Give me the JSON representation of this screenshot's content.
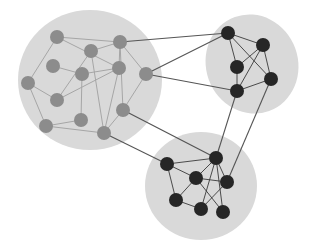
{
  "diagram": {
    "type": "clustered-network-graph",
    "colors": {
      "background": "#ffffff",
      "cluster_fill": "#d9d9d9",
      "grey_node": "#8c8c8c",
      "dark_node": "#262626",
      "intra_edge_light": "#a6a6a6",
      "inter_edge": "#555555",
      "intra_edge_dark": "#3a3a3a"
    },
    "clusters": [
      {
        "id": "left",
        "shape": "circle",
        "cx": 90,
        "cy": 80,
        "rx": 72,
        "ry": 70,
        "rotate": 0
      },
      {
        "id": "top-right",
        "shape": "ellipse",
        "cx": 252,
        "cy": 64,
        "rx": 46,
        "ry": 50,
        "rotate": -20
      },
      {
        "id": "bottom",
        "shape": "circle",
        "cx": 201,
        "cy": 186,
        "rx": 56,
        "ry": 54,
        "rotate": 0
      }
    ],
    "nodes": [
      {
        "id": "A",
        "x": 57,
        "y": 37,
        "cluster": "left",
        "style": "grey"
      },
      {
        "id": "B",
        "x": 120,
        "y": 42,
        "cluster": "left",
        "style": "grey"
      },
      {
        "id": "C",
        "x": 91,
        "y": 51,
        "cluster": "left",
        "style": "grey"
      },
      {
        "id": "D",
        "x": 53,
        "y": 66,
        "cluster": "left",
        "style": "grey"
      },
      {
        "id": "E",
        "x": 82,
        "y": 74,
        "cluster": "left",
        "style": "grey"
      },
      {
        "id": "F",
        "x": 119,
        "y": 68,
        "cluster": "left",
        "style": "grey"
      },
      {
        "id": "G",
        "x": 146,
        "y": 74,
        "cluster": "left",
        "style": "grey"
      },
      {
        "id": "H",
        "x": 28,
        "y": 83,
        "cluster": "left",
        "style": "grey"
      },
      {
        "id": "I",
        "x": 57,
        "y": 100,
        "cluster": "left",
        "style": "grey"
      },
      {
        "id": "J",
        "x": 123,
        "y": 110,
        "cluster": "left",
        "style": "grey"
      },
      {
        "id": "K",
        "x": 46,
        "y": 126,
        "cluster": "left",
        "style": "grey"
      },
      {
        "id": "L",
        "x": 81,
        "y": 120,
        "cluster": "left",
        "style": "grey"
      },
      {
        "id": "M",
        "x": 104,
        "y": 133,
        "cluster": "left",
        "style": "grey"
      },
      {
        "id": "N",
        "x": 228,
        "y": 33,
        "cluster": "top-right",
        "style": "dark"
      },
      {
        "id": "O",
        "x": 263,
        "y": 45,
        "cluster": "top-right",
        "style": "dark"
      },
      {
        "id": "P",
        "x": 237,
        "y": 67,
        "cluster": "top-right",
        "style": "dark"
      },
      {
        "id": "Q",
        "x": 271,
        "y": 79,
        "cluster": "top-right",
        "style": "dark"
      },
      {
        "id": "R",
        "x": 237,
        "y": 91,
        "cluster": "top-right",
        "style": "dark"
      },
      {
        "id": "S",
        "x": 167,
        "y": 164,
        "cluster": "bottom",
        "style": "dark"
      },
      {
        "id": "T",
        "x": 216,
        "y": 158,
        "cluster": "bottom",
        "style": "dark"
      },
      {
        "id": "U",
        "x": 196,
        "y": 178,
        "cluster": "bottom",
        "style": "dark"
      },
      {
        "id": "V",
        "x": 227,
        "y": 182,
        "cluster": "bottom",
        "style": "dark"
      },
      {
        "id": "W",
        "x": 176,
        "y": 200,
        "cluster": "bottom",
        "style": "dark"
      },
      {
        "id": "X",
        "x": 201,
        "y": 209,
        "cluster": "bottom",
        "style": "dark"
      },
      {
        "id": "Y",
        "x": 223,
        "y": 212,
        "cluster": "bottom",
        "style": "dark"
      }
    ],
    "edges": [
      {
        "from": "A",
        "to": "B",
        "kind": "intra-light"
      },
      {
        "from": "A",
        "to": "H",
        "kind": "intra-light"
      },
      {
        "from": "A",
        "to": "F",
        "kind": "intra-light"
      },
      {
        "from": "C",
        "to": "B",
        "kind": "intra-light"
      },
      {
        "from": "C",
        "to": "I",
        "kind": "intra-light"
      },
      {
        "from": "C",
        "to": "M",
        "kind": "intra-light"
      },
      {
        "from": "B",
        "to": "F",
        "kind": "intra-light"
      },
      {
        "from": "B",
        "to": "J",
        "kind": "intra-light"
      },
      {
        "from": "D",
        "to": "E",
        "kind": "intra-light"
      },
      {
        "from": "E",
        "to": "F",
        "kind": "intra-light"
      },
      {
        "from": "E",
        "to": "L",
        "kind": "intra-light"
      },
      {
        "from": "F",
        "to": "I",
        "kind": "intra-light"
      },
      {
        "from": "F",
        "to": "M",
        "kind": "intra-light"
      },
      {
        "from": "G",
        "to": "J",
        "kind": "intra-light"
      },
      {
        "from": "G",
        "to": "B",
        "kind": "intra-light"
      },
      {
        "from": "H",
        "to": "I",
        "kind": "intra-light"
      },
      {
        "from": "H",
        "to": "K",
        "kind": "intra-light"
      },
      {
        "from": "K",
        "to": "L",
        "kind": "intra-light"
      },
      {
        "from": "K",
        "to": "M",
        "kind": "intra-light"
      },
      {
        "from": "J",
        "to": "M",
        "kind": "intra-light"
      },
      {
        "from": "N",
        "to": "O",
        "kind": "intra-dark"
      },
      {
        "from": "N",
        "to": "P",
        "kind": "intra-dark"
      },
      {
        "from": "N",
        "to": "Q",
        "kind": "intra-dark"
      },
      {
        "from": "O",
        "to": "P",
        "kind": "intra-dark"
      },
      {
        "from": "O",
        "to": "Q",
        "kind": "intra-dark"
      },
      {
        "from": "O",
        "to": "R",
        "kind": "intra-dark"
      },
      {
        "from": "P",
        "to": "R",
        "kind": "intra-dark"
      },
      {
        "from": "Q",
        "to": "R",
        "kind": "intra-dark"
      },
      {
        "from": "S",
        "to": "T",
        "kind": "intra-dark"
      },
      {
        "from": "S",
        "to": "U",
        "kind": "intra-dark"
      },
      {
        "from": "S",
        "to": "W",
        "kind": "intra-dark"
      },
      {
        "from": "T",
        "to": "U",
        "kind": "intra-dark"
      },
      {
        "from": "T",
        "to": "V",
        "kind": "intra-dark"
      },
      {
        "from": "T",
        "to": "X",
        "kind": "intra-dark"
      },
      {
        "from": "T",
        "to": "Y",
        "kind": "intra-dark"
      },
      {
        "from": "U",
        "to": "V",
        "kind": "intra-dark"
      },
      {
        "from": "U",
        "to": "W",
        "kind": "intra-dark"
      },
      {
        "from": "U",
        "to": "Y",
        "kind": "intra-dark"
      },
      {
        "from": "V",
        "to": "X",
        "kind": "intra-dark"
      },
      {
        "from": "W",
        "to": "X",
        "kind": "intra-dark"
      },
      {
        "from": "B",
        "to": "N",
        "kind": "inter"
      },
      {
        "from": "G",
        "to": "N",
        "kind": "inter"
      },
      {
        "from": "G",
        "to": "R",
        "kind": "inter"
      },
      {
        "from": "J",
        "to": "T",
        "kind": "inter"
      },
      {
        "from": "M",
        "to": "S",
        "kind": "inter"
      },
      {
        "from": "R",
        "to": "T",
        "kind": "inter"
      },
      {
        "from": "Q",
        "to": "V",
        "kind": "inter"
      }
    ],
    "node_radius": 7
  }
}
